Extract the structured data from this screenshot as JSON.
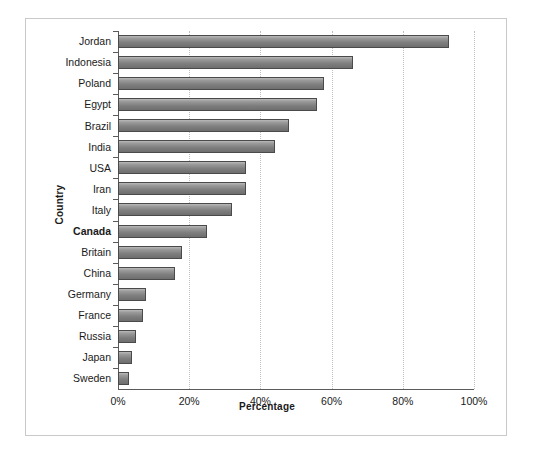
{
  "chart_data": {
    "type": "bar",
    "orientation": "horizontal",
    "title": "",
    "xlabel": "Percentage",
    "ylabel": "Country",
    "xlim": [
      0,
      100
    ],
    "xticks": [
      "0%",
      "20%",
      "40%",
      "60%",
      "80%",
      "100%"
    ],
    "xtick_values": [
      0,
      20,
      40,
      60,
      80,
      100
    ],
    "grid": "vertical-dotted",
    "legend": "none",
    "highlight_category": "Canada",
    "categories": [
      "Jordan",
      "Indonesia",
      "Poland",
      "Egypt",
      "Brazil",
      "India",
      "USA",
      "Iran",
      "Italy",
      "Canada",
      "Britain",
      "China",
      "Germany",
      "France",
      "Russia",
      "Japan",
      "Sweden"
    ],
    "values": [
      93,
      66,
      58,
      56,
      48,
      44,
      36,
      36,
      32,
      25,
      18,
      16,
      8,
      7,
      5,
      4,
      3
    ],
    "bar_color": "#8c8c8c",
    "bar_border_color": "#4a4a4a",
    "grid_color": "#c0c0c0",
    "axis_color": "#5a5a5a",
    "text_color": "#1a1a1a"
  }
}
